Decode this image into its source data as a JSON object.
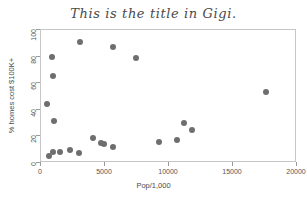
{
  "chart_data": {
    "type": "scatter",
    "title": "This is the title in Gigi.",
    "xlabel": "Pop/1,000",
    "ylabel": "% homes cost $100K+",
    "xlim": [
      0,
      20000
    ],
    "ylim": [
      0,
      100
    ],
    "xticks": [
      0,
      5000,
      10000,
      15000,
      20000
    ],
    "xticklabels": [
      "0",
      "5000",
      "10000",
      "15000",
      "20000"
    ],
    "yticks": [
      0,
      20,
      40,
      60,
      80,
      100
    ],
    "yticklabels": [
      "0",
      "20",
      "40",
      "60",
      "80",
      "100"
    ],
    "grid": false,
    "legend": null,
    "marker_color": "#6e6e6e",
    "frame_color": "#c6c6c6",
    "points": [
      {
        "x": 480,
        "y": 44.2
      },
      {
        "x": 620,
        "y": 5.2
      },
      {
        "x": 880,
        "y": 79.6
      },
      {
        "x": 900,
        "y": 65.4
      },
      {
        "x": 950,
        "y": 8.0
      },
      {
        "x": 1050,
        "y": 31.8
      },
      {
        "x": 1450,
        "y": 8.6
      },
      {
        "x": 2250,
        "y": 9.8
      },
      {
        "x": 2950,
        "y": 7.2
      },
      {
        "x": 3050,
        "y": 91.0
      },
      {
        "x": 4050,
        "y": 18.8
      },
      {
        "x": 4700,
        "y": 14.8
      },
      {
        "x": 4950,
        "y": 14.4
      },
      {
        "x": 5600,
        "y": 87.0
      },
      {
        "x": 5650,
        "y": 12.2
      },
      {
        "x": 7400,
        "y": 78.8
      },
      {
        "x": 9250,
        "y": 16.0
      },
      {
        "x": 10650,
        "y": 17.0
      },
      {
        "x": 11200,
        "y": 30.4
      },
      {
        "x": 11800,
        "y": 25.0
      },
      {
        "x": 17550,
        "y": 53.4
      }
    ]
  }
}
